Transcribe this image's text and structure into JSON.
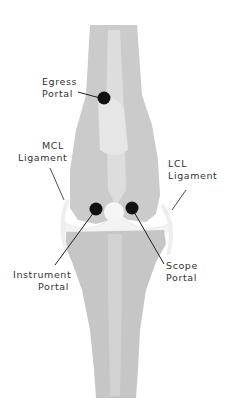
{
  "diagram": {
    "colors": {
      "bone": "#c9c9c9",
      "bone_light": "#e4e4e4",
      "cartilage": "#f4f4f4",
      "portal_dot": "#111111",
      "leader_line": "#222222",
      "label_text": "#333333",
      "background": "#ffffff"
    },
    "labels": {
      "egress": {
        "line1": "Egress",
        "line2": "Portal"
      },
      "mcl": {
        "line1": "MCL",
        "line2": "Ligament"
      },
      "lcl": {
        "line1": "LCL",
        "line2": "Ligament"
      },
      "instrument": {
        "line1": "Instrument",
        "line2": "Portal"
      },
      "scope": {
        "line1": "Scope",
        "line2": "Portal"
      }
    }
  }
}
